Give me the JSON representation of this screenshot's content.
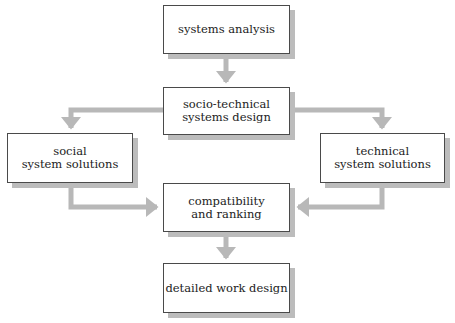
{
  "diagram": {
    "nodes": [
      {
        "id": "systems-analysis",
        "label": "systems analysis"
      },
      {
        "id": "socio-technical",
        "label": "socio-technical\nsystems design"
      },
      {
        "id": "social",
        "label": "social\nsystem solutions"
      },
      {
        "id": "technical",
        "label": "technical\nsystem solutions"
      },
      {
        "id": "compatibility",
        "label": "compatibility\nand ranking"
      },
      {
        "id": "detailed",
        "label": "detailed work design"
      }
    ],
    "edges": [
      {
        "from": "systems-analysis",
        "to": "socio-technical"
      },
      {
        "from": "socio-technical",
        "to": "social"
      },
      {
        "from": "socio-technical",
        "to": "technical"
      },
      {
        "from": "social",
        "to": "compatibility"
      },
      {
        "from": "technical",
        "to": "compatibility"
      },
      {
        "from": "compatibility",
        "to": "detailed"
      }
    ],
    "colors": {
      "border": "#4a4a4a",
      "shadow": "#bcbcbc",
      "connector": "#b8b8b8"
    }
  }
}
